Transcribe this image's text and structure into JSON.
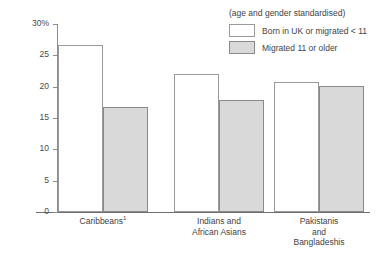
{
  "chart_data": {
    "type": "bar",
    "title": "",
    "subtitle": "(age and gender standardised)",
    "xlabel": "",
    "ylabel": "",
    "ylim": [
      0,
      30
    ],
    "yticks": [
      "0",
      "5",
      "10",
      "15",
      "20",
      "25",
      "30%"
    ],
    "ytick_values": [
      0,
      5,
      10,
      15,
      20,
      25,
      30
    ],
    "grid": false,
    "legend_position": "top-right",
    "categories": [
      "Caribbeans",
      "Indians and African Asians",
      "Pakistanis and Bangladeshis"
    ],
    "category_labels": [
      [
        "Caribbeans"
      ],
      [
        "Indians and",
        "African Asians"
      ],
      [
        "Pakistanis",
        "and",
        "Bangladeshis"
      ]
    ],
    "category_footnote_marker": "1",
    "series": [
      {
        "name": "Born in UK or migrated < 11",
        "style": "light",
        "color": "#ffffff",
        "values": [
          26.6,
          22.0,
          20.7
        ]
      },
      {
        "name": "Migrated 11 or older",
        "style": "shaded",
        "color": "#d9d9d9",
        "values": [
          16.8,
          17.9,
          20.1
        ]
      }
    ]
  },
  "legend": {
    "note": "(age and gender standardised)",
    "items": [
      {
        "label": "Born in UK or migrated < 11",
        "style": "light"
      },
      {
        "label": "Migrated 11 or older",
        "style": "shaded"
      }
    ]
  },
  "colors": {
    "light_fill": "#ffffff",
    "shaded_fill": "#d9d9d9",
    "bar_border": "#9a9a9a",
    "axis": "#8d8d8d",
    "text": "#3f3f3f"
  }
}
